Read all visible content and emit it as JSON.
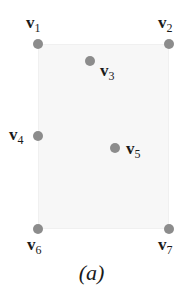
{
  "figure": {
    "caption": "(a)",
    "region": {
      "x": 38,
      "y": 44,
      "width": 131,
      "height": 185,
      "fill": "#f7f7f7"
    },
    "point_color": "#8c8c8c",
    "vertices": [
      {
        "id": "v1",
        "base": "v",
        "sub": "1",
        "x": 38,
        "y": 44
      },
      {
        "id": "v2",
        "base": "v",
        "sub": "2",
        "x": 169,
        "y": 44
      },
      {
        "id": "v3",
        "base": "v",
        "sub": "3",
        "x": 90,
        "y": 61
      },
      {
        "id": "v4",
        "base": "v",
        "sub": "4",
        "x": 38,
        "y": 136
      },
      {
        "id": "v5",
        "base": "v",
        "sub": "5",
        "x": 115,
        "y": 148
      },
      {
        "id": "v6",
        "base": "v",
        "sub": "6",
        "x": 38,
        "y": 229
      },
      {
        "id": "v7",
        "base": "v",
        "sub": "7",
        "x": 169,
        "y": 229
      }
    ]
  }
}
